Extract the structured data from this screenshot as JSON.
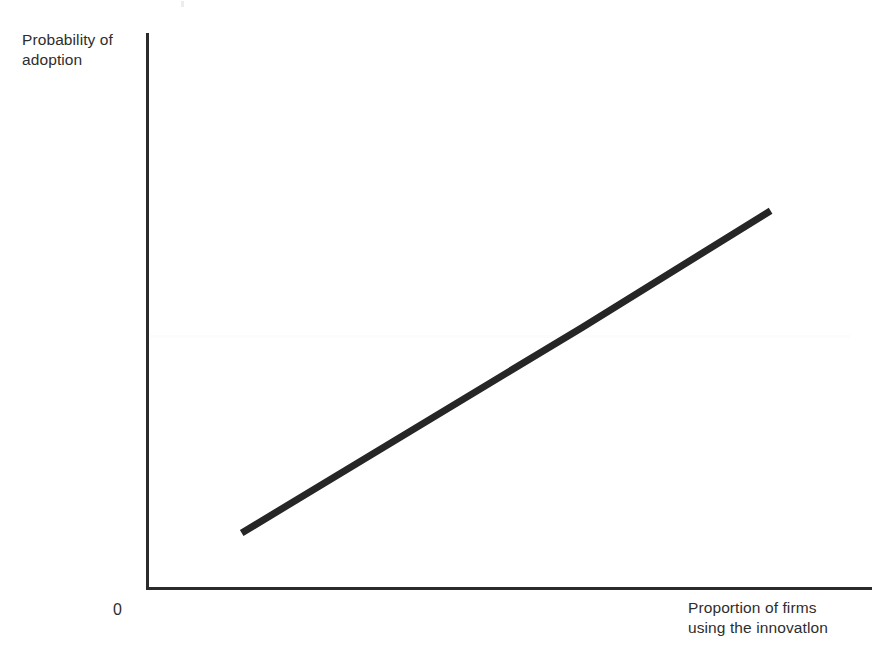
{
  "chart_data": {
    "type": "line",
    "title": "",
    "subtitle": "",
    "xlabel": "Proportion of firms using the innovatlon",
    "ylabel": "Probability of adoption",
    "origin_label": "0",
    "grid": false,
    "legend": null,
    "xlim": [
      0,
      1
    ],
    "ylim": [
      0,
      1
    ],
    "x_ticks": [],
    "y_ticks": [],
    "x_tick_labels": [],
    "y_tick_labels": [],
    "annotations": [],
    "series": [
      {
        "name": "Probability of adoption",
        "color": "#262626",
        "line_width": 7,
        "x": [
          0.13,
          0.6,
          0.86
        ],
        "y": [
          0.1,
          0.47,
          0.68
        ],
        "description": "Upward-sloping near-linear relationship with a slight kink near the middle"
      }
    ]
  },
  "labels": {
    "y_axis_line1": "Probability of",
    "y_axis_line2": "adoption",
    "x_axis_line1": "Proportion of firms",
    "x_axis_line2": "using the innovatlon",
    "origin": "0"
  },
  "colors": {
    "background": "#ffffff",
    "axis": "#2b2b2b",
    "line": "#262626",
    "text": "#2e2e2e"
  }
}
